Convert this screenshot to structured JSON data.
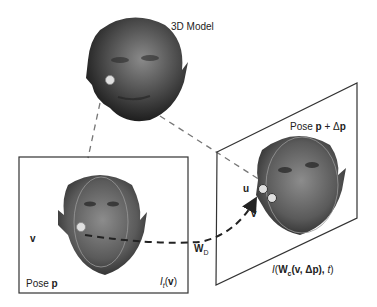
{
  "diagram": {
    "model_label": "3D Model",
    "left_frame": {
      "pose_prefix": "Pose ",
      "pose_var": "p",
      "image_func": "I",
      "image_sub": "t",
      "image_arg": "v",
      "point_label": "v"
    },
    "right_frame": {
      "pose_prefix": "Pose ",
      "pose_var": "p",
      "pose_op": " + Δ",
      "pose_delta_var": "p",
      "point_u": "u",
      "point_v": "v",
      "image_expr_I": "I",
      "image_expr_W": "W",
      "image_expr_Wsub": "c",
      "image_expr_args": "(v, Δp), ",
      "image_expr_t": "t",
      "image_expr_close": ")"
    },
    "warp_label": "W",
    "warp_sub": "D",
    "colors": {
      "face_dark": "#2e2e2e",
      "face_mid": "#6b6b6b",
      "point_fill": "#d8d8d8",
      "line": "#333333",
      "dash_gray": "#777777"
    }
  }
}
